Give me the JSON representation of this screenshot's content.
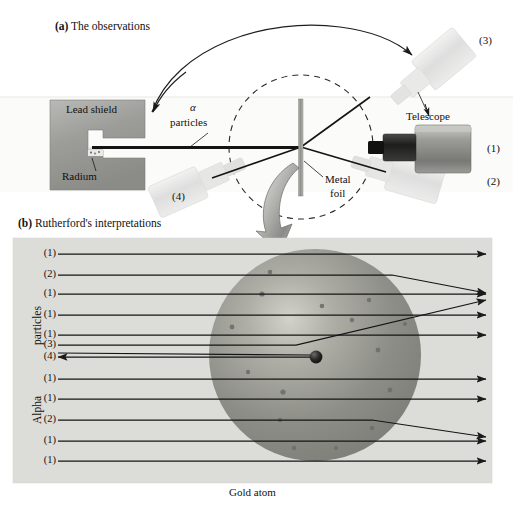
{
  "figure": {
    "panel_a": {
      "tag": "(a)",
      "title": "The observations",
      "labels": {
        "lead_shield": "Lead shield",
        "radium": "Radium",
        "alpha": "α",
        "particles": "particles",
        "telescope": "Telescope",
        "metal": "Metal",
        "foil": "foil"
      },
      "position_markers": [
        "(3)",
        "(1)",
        "(2)",
        "(4)"
      ]
    },
    "panel_b": {
      "tag": "(b)",
      "title": "Rutherford's interpretations",
      "axis_label_top": "particles",
      "axis_label_bottom": "Alpha",
      "caption": "Gold atom",
      "beam_rows": [
        {
          "label": "(1)",
          "y": 254,
          "kind": "straight"
        },
        {
          "label": "(2)",
          "y": 275,
          "kind": "deflect-down",
          "end_y": 293
        },
        {
          "label": "(1)",
          "y": 294,
          "kind": "straight"
        },
        {
          "label": "(1)",
          "y": 315,
          "kind": "straight"
        },
        {
          "label": "(1)",
          "y": 335,
          "kind": "straight"
        },
        {
          "label": "(3)",
          "y": 345,
          "kind": "deflect-up",
          "bend_x": 296,
          "end_y": 300
        },
        {
          "label": "(4)",
          "y": 357,
          "kind": "backscatter"
        },
        {
          "label": "(1)",
          "y": 379,
          "kind": "straight"
        },
        {
          "label": "(1)",
          "y": 399,
          "kind": "straight"
        },
        {
          "label": "(2)",
          "y": 420,
          "kind": "deflect-down",
          "end_y": 437
        },
        {
          "label": "(1)",
          "y": 441,
          "kind": "straight"
        },
        {
          "label": "(1)",
          "y": 461,
          "kind": "straight"
        }
      ]
    }
  },
  "colors": {
    "panel_bg": "#dcdcd8",
    "atom_body": "#8f8f8a",
    "atom_light": "#c9c9c2",
    "nucleus": "#1b1b1b",
    "shield": "#9a9a96",
    "telescope_body": "#8d8d89",
    "telescope_ghost": "#e2e2e0",
    "line": "#1a1a1a",
    "ink": "#111111"
  }
}
